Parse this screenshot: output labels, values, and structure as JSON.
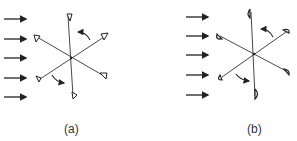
{
  "figure": {
    "panels": [
      {
        "id": "a",
        "caption": "(a)",
        "blade_shape": "triangular",
        "wind_arrow_count": 5,
        "rotation_arrows": 2
      },
      {
        "id": "b",
        "caption": "(b)",
        "blade_shape": "semicircular-cup",
        "wind_arrow_count": 5,
        "rotation_arrows": 2
      }
    ],
    "colors": {
      "stroke": "#222222",
      "background": "#ffffff"
    }
  }
}
